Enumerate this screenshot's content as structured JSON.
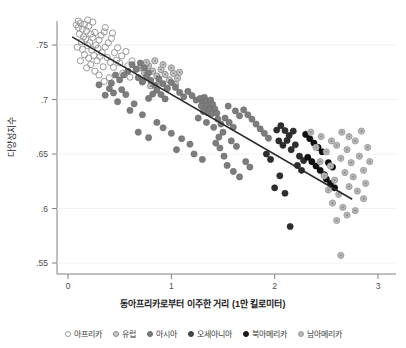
{
  "axes": {
    "ylabel": "다양성지수",
    "xlabel": "동아프리카로부터 이주한 거리 (1만 킬로미터)",
    "yticks": [
      ".75",
      ".7",
      ".65",
      ".6",
      ".55"
    ],
    "xticks": [
      "0",
      "1",
      "2",
      "3"
    ]
  },
  "legend": [
    {
      "label": "아프리카",
      "marker": "open-circle",
      "color": "#ffffff",
      "edge": "#9a9a9a"
    },
    {
      "label": "유럽",
      "marker": "ring-dot",
      "color": "#c9c9c9",
      "edge": "#8a8a8a"
    },
    {
      "label": "아시아",
      "marker": "filled",
      "color": "#7d7d7d",
      "edge": "#6a6a6a"
    },
    {
      "label": "오세아니아",
      "marker": "filled",
      "color": "#4a4a4a",
      "edge": "#3c3c3c"
    },
    {
      "label": "북아메리카",
      "marker": "filled",
      "color": "#1a1a1a",
      "edge": "#111111"
    },
    {
      "label": "남아메리카",
      "marker": "ring-dot",
      "color": "#b8b8b8",
      "edge": "#9e9e9e"
    }
  ],
  "chart_data": {
    "type": "scatter",
    "title": "",
    "xlabel": "동아프리카로부터 이주한 거리 (1만 킬로미터)",
    "ylabel": "다양성지수",
    "xlim": [
      -0.05,
      3.1
    ],
    "ylim": [
      0.535,
      0.775
    ],
    "grid": false,
    "legend_position": "bottom",
    "trendline": {
      "type": "linear",
      "x_start": 0.04,
      "y_start": 0.7575,
      "x_end": 2.75,
      "y_end": 0.6085,
      "color": "#2a2a2a"
    },
    "series": [
      {
        "name": "아프리카",
        "color": "#ffffff",
        "edge": "#9a9a9a",
        "marker": "open-circle",
        "points": [
          [
            0.08,
            0.7685
          ],
          [
            0.1,
            0.766
          ],
          [
            0.12,
            0.77
          ],
          [
            0.14,
            0.7645
          ],
          [
            0.16,
            0.769
          ],
          [
            0.11,
            0.76
          ],
          [
            0.15,
            0.7575
          ],
          [
            0.18,
            0.763
          ],
          [
            0.2,
            0.767
          ],
          [
            0.22,
            0.76
          ],
          [
            0.13,
            0.753
          ],
          [
            0.17,
            0.7555
          ],
          [
            0.21,
            0.752
          ],
          [
            0.24,
            0.757
          ],
          [
            0.26,
            0.7615
          ],
          [
            0.09,
            0.748
          ],
          [
            0.14,
            0.746
          ],
          [
            0.19,
            0.7495
          ],
          [
            0.23,
            0.7455
          ],
          [
            0.27,
            0.75
          ],
          [
            0.3,
            0.7545
          ],
          [
            0.32,
            0.759
          ],
          [
            0.35,
            0.762
          ],
          [
            0.29,
            0.747
          ],
          [
            0.33,
            0.743
          ],
          [
            0.16,
            0.741
          ],
          [
            0.2,
            0.738
          ],
          [
            0.25,
            0.7405
          ],
          [
            0.28,
            0.7355
          ],
          [
            0.31,
            0.7395
          ],
          [
            0.36,
            0.748
          ],
          [
            0.39,
            0.752
          ],
          [
            0.42,
            0.756
          ],
          [
            0.45,
            0.743
          ],
          [
            0.48,
            0.7475
          ],
          [
            0.38,
            0.7385
          ],
          [
            0.41,
            0.734
          ],
          [
            0.34,
            0.73
          ],
          [
            0.22,
            0.732
          ],
          [
            0.18,
            0.729
          ],
          [
            0.52,
            0.74
          ],
          [
            0.56,
            0.744
          ],
          [
            0.5,
            0.7335
          ],
          [
            0.44,
            0.7295
          ],
          [
            0.47,
            0.736
          ],
          [
            0.12,
            0.7355
          ],
          [
            0.26,
            0.726
          ],
          [
            0.3,
            0.7225
          ],
          [
            0.58,
            0.731
          ],
          [
            0.62,
            0.7355
          ],
          [
            0.1,
            0.772
          ],
          [
            0.24,
            0.771
          ],
          [
            0.19,
            0.773
          ],
          [
            0.36,
            0.766
          ],
          [
            0.43,
            0.761
          ],
          [
            0.66,
            0.7275
          ],
          [
            0.4,
            0.72
          ],
          [
            0.35,
            0.7165
          ],
          [
            0.53,
            0.724
          ],
          [
            0.6,
            0.7205
          ]
        ]
      },
      {
        "name": "유럽",
        "color": "#c9c9c9",
        "edge": "#8a8a8a",
        "marker": "ring-dot",
        "points": [
          [
            0.7,
            0.729
          ],
          [
            0.74,
            0.7245
          ],
          [
            0.78,
            0.731
          ],
          [
            0.82,
            0.726
          ],
          [
            0.86,
            0.7215
          ],
          [
            0.9,
            0.7275
          ],
          [
            0.94,
            0.723
          ],
          [
            0.98,
            0.718
          ],
          [
            1.02,
            0.724
          ],
          [
            1.06,
            0.7195
          ],
          [
            0.72,
            0.716
          ],
          [
            0.8,
            0.7125
          ],
          [
            0.88,
            0.715
          ],
          [
            0.96,
            0.7105
          ],
          [
            1.04,
            0.714
          ],
          [
            0.76,
            0.734
          ],
          [
            0.84,
            0.7355
          ],
          [
            0.92,
            0.732
          ],
          [
            1.0,
            0.729
          ],
          [
            1.08,
            0.725
          ]
        ]
      },
      {
        "name": "아시아",
        "color": "#7d7d7d",
        "edge": "#6a6a6a",
        "marker": "filled",
        "points": [
          [
            0.62,
            0.732
          ],
          [
            0.66,
            0.728
          ],
          [
            0.7,
            0.7335
          ],
          [
            0.74,
            0.729
          ],
          [
            0.78,
            0.7245
          ],
          [
            0.68,
            0.72
          ],
          [
            0.72,
            0.7165
          ],
          [
            0.76,
            0.721
          ],
          [
            0.8,
            0.7175
          ],
          [
            0.84,
            0.713
          ],
          [
            0.58,
            0.726
          ],
          [
            0.54,
            0.7225
          ],
          [
            0.5,
            0.718
          ],
          [
            0.46,
            0.7225
          ],
          [
            0.42,
            0.715
          ],
          [
            0.88,
            0.719
          ],
          [
            0.92,
            0.7145
          ],
          [
            0.96,
            0.71
          ],
          [
            1.0,
            0.7155
          ],
          [
            1.04,
            0.711
          ],
          [
            0.86,
            0.7085
          ],
          [
            0.9,
            0.7045
          ],
          [
            0.94,
            0.7005
          ],
          [
            0.82,
            0.705
          ],
          [
            0.78,
            0.701
          ],
          [
            1.08,
            0.7065
          ],
          [
            1.12,
            0.7025
          ],
          [
            1.16,
            0.7075
          ],
          [
            1.2,
            0.7035
          ],
          [
            1.24,
            0.6995
          ],
          [
            0.4,
            0.71
          ],
          [
            0.44,
            0.706
          ],
          [
            0.36,
            0.704
          ],
          [
            0.52,
            0.709
          ],
          [
            0.56,
            0.7045
          ],
          [
            1.28,
            0.701
          ],
          [
            1.3,
            0.697
          ],
          [
            1.32,
            0.702
          ],
          [
            1.34,
            0.6985
          ],
          [
            1.36,
            0.6945
          ],
          [
            1.33,
            0.6915
          ],
          [
            1.35,
            0.688
          ],
          [
            1.31,
            0.689
          ],
          [
            1.37,
            0.691
          ],
          [
            1.39,
            0.687
          ],
          [
            1.29,
            0.694
          ],
          [
            1.38,
            0.6995
          ],
          [
            1.4,
            0.6955
          ],
          [
            1.42,
            0.6915
          ],
          [
            1.44,
            0.6875
          ],
          [
            1.26,
            0.683
          ],
          [
            1.34,
            0.679
          ],
          [
            1.41,
            0.6745
          ],
          [
            1.45,
            0.682
          ],
          [
            1.48,
            0.6775
          ],
          [
            0.64,
            0.696
          ],
          [
            0.6,
            0.69
          ],
          [
            0.72,
            0.686
          ],
          [
            0.48,
            0.698
          ],
          [
            0.3,
            0.7135
          ],
          [
            1.52,
            0.683
          ],
          [
            1.56,
            0.679
          ],
          [
            1.6,
            0.6745
          ],
          [
            1.5,
            0.67
          ],
          [
            1.46,
            0.6655
          ],
          [
            1.55,
            0.694
          ],
          [
            1.62,
            0.6895
          ],
          [
            1.66,
            0.685
          ],
          [
            1.7,
            0.6905
          ],
          [
            1.74,
            0.686
          ],
          [
            1.43,
            0.66
          ],
          [
            1.47,
            0.6555
          ],
          [
            1.51,
            0.648
          ],
          [
            1.58,
            0.662
          ],
          [
            1.63,
            0.657
          ],
          [
            0.86,
            0.679
          ],
          [
            0.92,
            0.674
          ],
          [
            1.0,
            0.669
          ],
          [
            1.1,
            0.664
          ],
          [
            1.18,
            0.659
          ],
          [
            1.78,
            0.682
          ],
          [
            1.82,
            0.6775
          ],
          [
            1.86,
            0.673
          ],
          [
            1.9,
            0.669
          ],
          [
            1.94,
            0.6645
          ],
          [
            0.68,
            0.67
          ],
          [
            0.78,
            0.665
          ],
          [
            1.05,
            0.654
          ],
          [
            1.22,
            0.65
          ],
          [
            1.3,
            0.645
          ],
          [
            1.54,
            0.6395
          ],
          [
            1.6,
            0.634
          ],
          [
            1.66,
            0.629
          ],
          [
            1.72,
            0.643
          ],
          [
            1.76,
            0.638
          ]
        ]
      },
      {
        "name": "오세아니아",
        "color": "#2e2e2e",
        "edge": "#222222",
        "marker": "filled",
        "points": [
          [
            2.02,
            0.672
          ],
          [
            2.06,
            0.676
          ],
          [
            2.1,
            0.6715
          ],
          [
            2.14,
            0.667
          ],
          [
            2.18,
            0.671
          ],
          [
            2.04,
            0.662
          ],
          [
            2.08,
            0.658
          ],
          [
            2.12,
            0.6625
          ],
          [
            2.16,
            0.654
          ],
          [
            2.2,
            0.6585
          ],
          [
            2.24,
            0.648
          ],
          [
            2.28,
            0.644
          ],
          [
            2.22,
            0.6395
          ],
          [
            2.26,
            0.635
          ],
          [
            2.05,
            0.63
          ],
          [
            2.0,
            0.619
          ],
          [
            2.1,
            0.614
          ],
          [
            2.15,
            0.5835
          ],
          [
            1.96,
            0.645
          ],
          [
            1.92,
            0.65
          ]
        ]
      },
      {
        "name": "북아메리카",
        "color": "#111111",
        "edge": "#000000",
        "marker": "filled",
        "points": [
          [
            2.3,
            0.668
          ],
          [
            2.34,
            0.664
          ],
          [
            2.38,
            0.66
          ],
          [
            2.42,
            0.656
          ],
          [
            2.46,
            0.652
          ],
          [
            2.32,
            0.647
          ],
          [
            2.36,
            0.643
          ],
          [
            2.4,
            0.639
          ],
          [
            2.44,
            0.635
          ],
          [
            2.48,
            0.631
          ],
          [
            2.52,
            0.642
          ],
          [
            2.56,
            0.638
          ],
          [
            2.5,
            0.627
          ],
          [
            2.54,
            0.623
          ],
          [
            2.58,
            0.619
          ]
        ]
      },
      {
        "name": "남아메리카",
        "color": "#b8b8b8",
        "edge": "#9e9e9e",
        "marker": "ring-dot",
        "points": [
          [
            2.35,
            0.67
          ],
          [
            2.45,
            0.666
          ],
          [
            2.55,
            0.662
          ],
          [
            2.65,
            0.67
          ],
          [
            2.72,
            0.666
          ],
          [
            2.4,
            0.656
          ],
          [
            2.5,
            0.652
          ],
          [
            2.6,
            0.658
          ],
          [
            2.7,
            0.654
          ],
          [
            2.78,
            0.662
          ],
          [
            2.44,
            0.643
          ],
          [
            2.54,
            0.639
          ],
          [
            2.64,
            0.646
          ],
          [
            2.74,
            0.642
          ],
          [
            2.82,
            0.648
          ],
          [
            2.48,
            0.63
          ],
          [
            2.58,
            0.626
          ],
          [
            2.68,
            0.633
          ],
          [
            2.76,
            0.629
          ],
          [
            2.86,
            0.635
          ],
          [
            2.52,
            0.617
          ],
          [
            2.62,
            0.613
          ],
          [
            2.72,
            0.62
          ],
          [
            2.8,
            0.616
          ],
          [
            2.88,
            0.623
          ],
          [
            2.56,
            0.605
          ],
          [
            2.66,
            0.601
          ],
          [
            2.6,
            0.589
          ],
          [
            2.7,
            0.594
          ],
          [
            2.64,
            0.557
          ],
          [
            2.9,
            0.656
          ],
          [
            2.84,
            0.671
          ],
          [
            2.92,
            0.643
          ],
          [
            2.86,
            0.609
          ],
          [
            2.78,
            0.598
          ]
        ]
      }
    ]
  }
}
